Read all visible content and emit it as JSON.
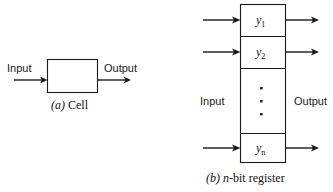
{
  "figure": {
    "kind": "textbook-line-drawing",
    "background_color": "#ffffff",
    "line_color": "#1a1a1a",
    "panels": [
      {
        "id": "a",
        "caption_marker": "(a)",
        "caption_text": "Cell",
        "caption_full": "(a) Cell",
        "input_label": "Input",
        "output_label": "Output"
      },
      {
        "id": "b",
        "caption_marker": "(b)",
        "caption_text": "n-bit register",
        "caption_italic_part": "n",
        "caption_rest": "-bit register",
        "caption_full": "(b) n-bit register",
        "input_label": "Input",
        "output_label": "Output",
        "cells": [
          {
            "label": "y",
            "subscript": "1"
          },
          {
            "label": "y",
            "subscript": "2"
          },
          {
            "label": "y",
            "subscript": "n"
          }
        ],
        "ellipsis_dots": 3
      }
    ]
  }
}
